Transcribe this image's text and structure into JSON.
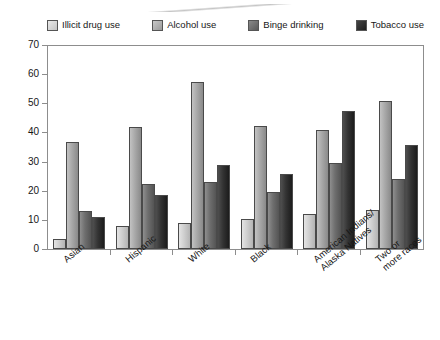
{
  "chart_data": {
    "type": "bar",
    "title": "",
    "subtitle": "",
    "xlabel": "",
    "ylabel": "",
    "ylim": [
      0,
      70
    ],
    "ytick_step": 10,
    "yticks": [
      0,
      10,
      20,
      30,
      40,
      50,
      60,
      70
    ],
    "grid": false,
    "legend_position": "top",
    "orientation": "vertical",
    "grouped": true,
    "categories": [
      "Asian",
      "Hispanic",
      "White",
      "Black",
      "American Indians/ Alaska Natives",
      "Two or more races"
    ],
    "category_lines": [
      [
        "Asian"
      ],
      [
        "Hispanic"
      ],
      [
        "White"
      ],
      [
        "Black"
      ],
      [
        "American Indians/",
        "Alaska Natives"
      ],
      [
        "Two or",
        "more races"
      ]
    ],
    "series": [
      {
        "name": "Illicit drug use",
        "color": "#cfcfcf",
        "values": [
          3.5,
          8.0,
          9.0,
          10.5,
          12.0,
          13.5
        ]
      },
      {
        "name": "Alcohol use",
        "color": "#a8a8a8",
        "values": [
          37.0,
          42.0,
          57.5,
          42.5,
          41.0,
          51.0
        ]
      },
      {
        "name": "Binge drinking",
        "color": "#6e6e6e",
        "values": [
          13.0,
          22.5,
          23.0,
          19.5,
          29.5,
          24.0
        ]
      },
      {
        "name": "Tobacco use",
        "color": "#333333",
        "values": [
          11.0,
          18.5,
          29.0,
          26.0,
          47.5,
          36.0
        ]
      }
    ]
  },
  "legend": {
    "items": [
      {
        "label": "Illicit drug use",
        "swatch": "#cfcfcf"
      },
      {
        "label": "Alcohol use",
        "swatch": "#a8a8a8"
      },
      {
        "label": "Binge drinking",
        "swatch": "#6e6e6e"
      },
      {
        "label": "Tobacco use",
        "swatch": "#333333"
      }
    ]
  },
  "axis": {
    "y_labels": [
      "70",
      "60",
      "50",
      "40",
      "30",
      "20",
      "10",
      "0"
    ]
  }
}
